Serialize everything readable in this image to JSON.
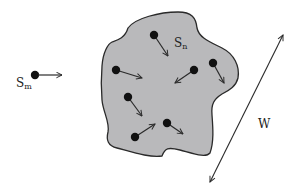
{
  "diagram": {
    "colors": {
      "background": "#ffffff",
      "region_fill": "#b9b9bb",
      "stroke": "#2a2a2a",
      "dot": "#111111"
    },
    "external_particle": {
      "label": "S",
      "subscript": "m",
      "dot": [
        35,
        75
      ],
      "arrow_to": [
        62,
        75
      ]
    },
    "region": {
      "label": "S",
      "subscript": "n",
      "particles": [
        {
          "dot": [
            154,
            35
          ],
          "arrow_to": [
            168,
            56
          ]
        },
        {
          "dot": [
            116,
            70
          ],
          "arrow_to": [
            142,
            78
          ]
        },
        {
          "dot": [
            194,
            70
          ],
          "arrow_to": [
            175,
            83
          ]
        },
        {
          "dot": [
            213,
            63
          ],
          "arrow_to": [
            224,
            83
          ]
        },
        {
          "dot": [
            128,
            97
          ],
          "arrow_to": [
            142,
            116
          ]
        },
        {
          "dot": [
            167,
            123
          ],
          "arrow_to": [
            183,
            134
          ]
        },
        {
          "dot": [
            135,
            137
          ],
          "arrow_to": [
            155,
            124
          ]
        }
      ]
    },
    "width_dimension": {
      "label": "W",
      "from": [
        283,
        35
      ],
      "to": [
        210,
        182
      ]
    }
  }
}
